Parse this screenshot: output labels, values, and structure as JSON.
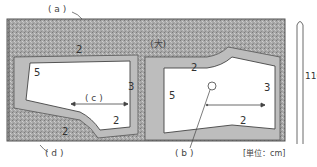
{
  "diagram": {
    "type": "sewing-pattern-layout",
    "fabric_label": "(大)",
    "fabric_width": "110",
    "unit_note": "[単位：cm]",
    "callouts": {
      "a": "( a )",
      "b": "( b )",
      "c": "( c )",
      "d": "( d )"
    },
    "seam_allowances": {
      "left_piece_top": "2",
      "left_piece_left": "5",
      "left_piece_right": "3",
      "left_piece_bottom": "2",
      "left_piece_bottom_curve": "2",
      "right_piece_top": "2",
      "right_piece_left": "5",
      "right_piece_right": "3",
      "right_piece_bottom": "2"
    },
    "colors": {
      "fabric": "#a9a9a9",
      "fabric_dark": "#8a8a8a",
      "piece": "#ffffff",
      "line": "#444444"
    }
  }
}
